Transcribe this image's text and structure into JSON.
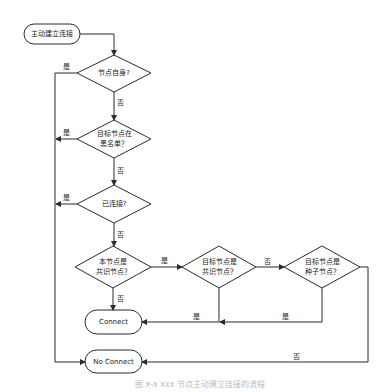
{
  "diagram": {
    "type": "flowchart",
    "nodes": {
      "start": {
        "label": "主动建立连接",
        "shape": "terminator"
      },
      "is_self": {
        "label": "节点自身?",
        "shape": "decision"
      },
      "blacklist": {
        "label": "目标节点在\n黑名单？",
        "shape": "decision"
      },
      "connected": {
        "label": "已连接?",
        "shape": "decision"
      },
      "self_consensus": {
        "label": "本节点是\n共识节点？",
        "shape": "decision"
      },
      "target_consensus": {
        "label": "目标节点是\n共识节点？",
        "shape": "decision"
      },
      "target_seed": {
        "label": "目标节点是\n种子节点？",
        "shape": "decision"
      },
      "connect": {
        "label": "Connect",
        "shape": "terminator"
      },
      "no_connect": {
        "label": "No Connect",
        "shape": "terminator"
      }
    },
    "edges": [
      {
        "from": "start",
        "to": "is_self",
        "label": ""
      },
      {
        "from": "is_self",
        "to": "no_connect",
        "label": "是"
      },
      {
        "from": "is_self",
        "to": "blacklist",
        "label": "否"
      },
      {
        "from": "blacklist",
        "to": "no_connect",
        "label": "是"
      },
      {
        "from": "blacklist",
        "to": "connected",
        "label": "否"
      },
      {
        "from": "connected",
        "to": "no_connect",
        "label": "是"
      },
      {
        "from": "connected",
        "to": "self_consensus",
        "label": "否"
      },
      {
        "from": "self_consensus",
        "to": "connect",
        "label": "否"
      },
      {
        "from": "self_consensus",
        "to": "target_consensus",
        "label": "是"
      },
      {
        "from": "target_consensus",
        "to": "connect",
        "label": "是"
      },
      {
        "from": "target_consensus",
        "to": "target_seed",
        "label": "否"
      },
      {
        "from": "target_seed",
        "to": "connect",
        "label": "是"
      },
      {
        "from": "target_seed",
        "to": "no_connect",
        "label": "否"
      }
    ],
    "edge_labels": {
      "yes": "是",
      "no": "否"
    },
    "caption": "图 x-x  xxx 节点主动建立连接的流程"
  }
}
